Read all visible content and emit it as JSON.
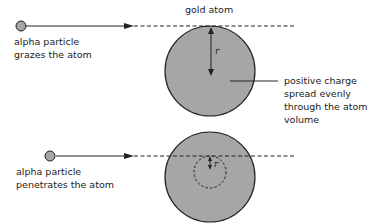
{
  "diagram": {
    "title_label": "gold atom",
    "top_scenario": {
      "label_line1": "alpha particle",
      "label_line2": "grazes the atom",
      "radius_label": "r"
    },
    "bottom_scenario": {
      "label_line1": "alpha particle",
      "label_line2": "penetrates the atom",
      "radius_label": "r"
    },
    "annotation": {
      "line1": "positive charge",
      "line2": "spread evenly",
      "line3": "through the atom",
      "line4": "volume"
    },
    "colors": {
      "atom_fill": "#a6a6a6",
      "particle_fill": "#a6a6a6",
      "stroke": "#222222"
    }
  }
}
